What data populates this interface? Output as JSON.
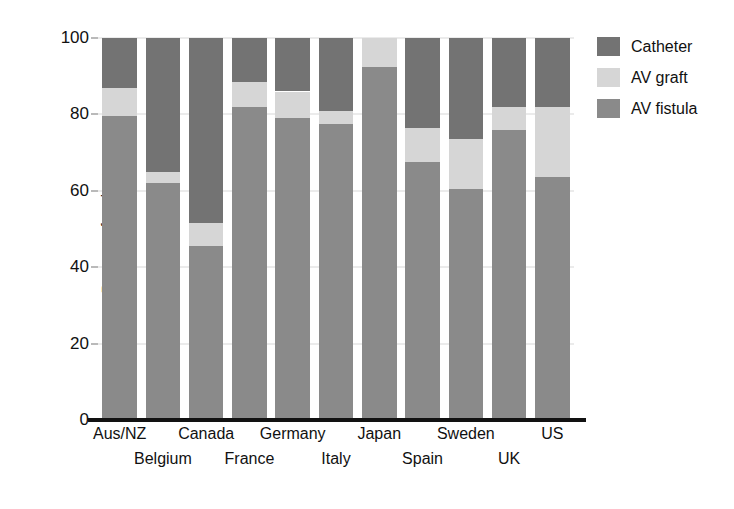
{
  "chart_data": {
    "type": "bar",
    "subtype": "stacked-bar-vertical",
    "title": "",
    "xlabel": "",
    "ylabel": "Percent of patients",
    "ylim": [
      0,
      100
    ],
    "yticks": [
      0,
      20,
      40,
      60,
      80,
      100
    ],
    "ytick_labels": [
      "0",
      "20",
      "40",
      "60",
      "80",
      "100"
    ],
    "grid": true,
    "grid_axis": "y",
    "legend_position": "right",
    "stack_order_bottom_to_top": [
      "AV fistula",
      "AV graft",
      "Catheter"
    ],
    "categories": [
      "Aus/NZ",
      "Belgium",
      "Canada",
      "France",
      "Germany",
      "Italy",
      "Japan",
      "Spain",
      "Sweden",
      "UK",
      "US"
    ],
    "series": [
      {
        "name": "AV fistula",
        "color": "#8a8a8a",
        "values": [
          79.5,
          62,
          45.5,
          82,
          79,
          77.5,
          92.5,
          67.5,
          60.5,
          76,
          63.5
        ]
      },
      {
        "name": "AV graft",
        "color": "#d6d6d6",
        "values": [
          7.5,
          3,
          6,
          6.5,
          7,
          3.5,
          7.5,
          9,
          13,
          6,
          18.5
        ]
      },
      {
        "name": "Catheter",
        "color": "#737373",
        "values": [
          13,
          35,
          48.5,
          11.5,
          14,
          19,
          0,
          23.5,
          26.5,
          18,
          18
        ]
      }
    ],
    "legend": [
      {
        "label": "Catheter",
        "color": "#737373",
        "swatch": "legend-swatch-catheter"
      },
      {
        "label": "AV graft",
        "color": "#d6d6d6",
        "swatch": "legend-swatch-av-graft"
      },
      {
        "label": "AV fistula",
        "color": "#8a8a8a",
        "swatch": "legend-swatch-av-fistula"
      }
    ],
    "xtick_label_rows": [
      0,
      1,
      0,
      1,
      0,
      1,
      0,
      1,
      0,
      1,
      0
    ]
  }
}
